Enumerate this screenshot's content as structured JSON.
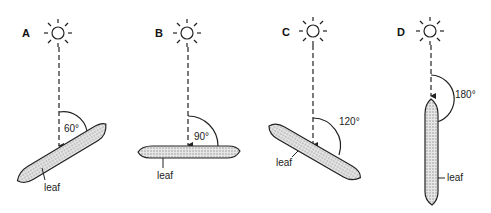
{
  "diagram": {
    "title": "",
    "panels": [
      {
        "id": "A",
        "label": "A",
        "angle_label": "60°",
        "angle_deg": 60,
        "leaf_label": "leaf"
      },
      {
        "id": "B",
        "label": "B",
        "angle_label": "90°",
        "angle_deg": 90,
        "leaf_label": "leaf"
      },
      {
        "id": "C",
        "label": "C",
        "angle_label": "120°",
        "angle_deg": 120,
        "leaf_label": "leaf"
      },
      {
        "id": "D",
        "label": "D",
        "angle_label": "180°",
        "angle_deg": 180,
        "leaf_label": "leaf"
      }
    ],
    "icons": {
      "sun": "sun-icon",
      "arrow": "arrow-down-icon"
    },
    "colors": {
      "line": "#222222",
      "leaf_fill": "#d8d8d8",
      "background": "#ffffff"
    }
  }
}
